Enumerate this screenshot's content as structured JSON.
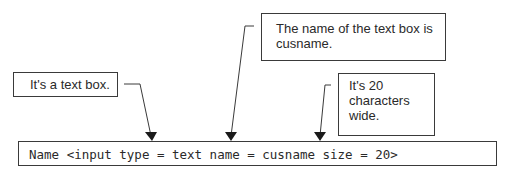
{
  "callouts": [
    {
      "id": "text-box",
      "text": "It's a text box."
    },
    {
      "id": "name",
      "text": "The name of the text box is cusname."
    },
    {
      "id": "size",
      "text": "It's 20 characters wide."
    }
  ],
  "code": {
    "line": "Name <input type = text name = cusname size = 20>"
  },
  "colors": {
    "line": "#3a3a3a",
    "text": "#2a2a2a",
    "background": "#ffffff"
  }
}
